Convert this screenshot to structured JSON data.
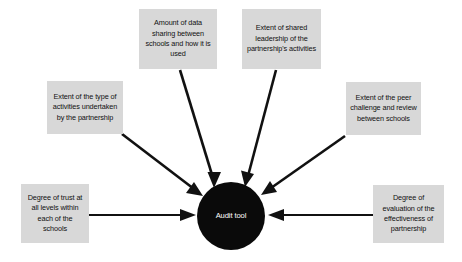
{
  "diagram": {
    "center": {
      "label": "Audit tool",
      "shape": "circle",
      "fill": "#0a0a0a",
      "text_color": "#ffffff"
    },
    "box_fill": "#d8d8d8",
    "box_text_color": "#111111",
    "arrow_color": "#111111",
    "background": "#ffffff",
    "factors": [
      {
        "id": "data-sharing",
        "label": "Amount of data sharing between schools and how it is used",
        "position": "top-left-of-center",
        "arrow": "diagonal-down-right"
      },
      {
        "id": "shared-leadership",
        "label": "Extent of shared leadership of the partnership's activities",
        "position": "top-right-of-center",
        "arrow": "diagonal-down-left"
      },
      {
        "id": "activities",
        "label": "Extent of the type of activities undertaken by the partnership",
        "position": "upper-left",
        "arrow": "diagonal-down-right"
      },
      {
        "id": "peer-challenge",
        "label": "Extent of the peer challenge and review between schools",
        "position": "upper-right",
        "arrow": "diagonal-down-left"
      },
      {
        "id": "trust",
        "label": "Degree of trust at all levels within each of the schools",
        "position": "left",
        "arrow": "horizontal-right"
      },
      {
        "id": "evaluation",
        "label": "Degree of evaluation of the effectiveness of partnership",
        "position": "right",
        "arrow": "horizontal-left"
      }
    ]
  }
}
